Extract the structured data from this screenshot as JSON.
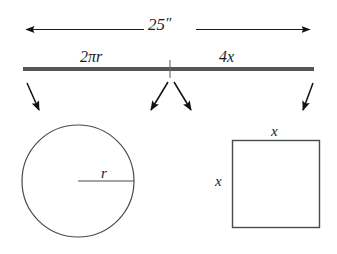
{
  "figure": {
    "stroke_color": "#4a4a4a",
    "bar_color": "#555555",
    "arrow_color": "#111111",
    "background": "#ffffff"
  },
  "dimension": {
    "value": "25",
    "unit_symbol": "″",
    "label_full": "25″"
  },
  "segments": [
    {
      "name": "circumference-part",
      "label": "2πr",
      "coefficient": "2",
      "symbol": "π",
      "variable": "r"
    },
    {
      "name": "perimeter-part",
      "label": "4x",
      "coefficient": "4",
      "variable": "x"
    }
  ],
  "shapes": {
    "circle": {
      "name": "circle",
      "radius_label": "r"
    },
    "square": {
      "name": "square",
      "top_side_label": "x",
      "left_side_label": "x"
    }
  },
  "arrows": {
    "count": 4,
    "items": [
      {
        "name": "arrow-to-circle-left",
        "direction": "down-right"
      },
      {
        "name": "arrow-to-circle-right",
        "direction": "down-left"
      },
      {
        "name": "arrow-to-square-left",
        "direction": "down-right"
      },
      {
        "name": "arrow-to-square-right",
        "direction": "down-left"
      }
    ]
  }
}
